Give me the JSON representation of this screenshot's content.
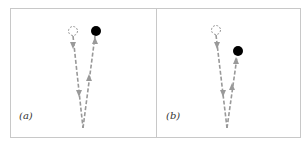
{
  "figure": {
    "panels": [
      {
        "label": "(a)",
        "description": "Outgoing path to dashed (virtual) target, returning path to filled (actual) target; both converge at origin",
        "origin": [
          83,
          128
        ],
        "virtual_target": [
          73,
          31
        ],
        "actual_target": [
          96,
          31
        ]
      },
      {
        "label": "(b)",
        "description": "Outgoing path to dashed (virtual) target, returning path to filled (actual) target located lower and to the right",
        "origin": [
          227,
          128
        ],
        "virtual_target": [
          216,
          30
        ],
        "actual_target": [
          238,
          51
        ]
      }
    ],
    "colors": {
      "path": "#999999",
      "target_fill": "#000000",
      "border": "#c8c8c8"
    }
  }
}
